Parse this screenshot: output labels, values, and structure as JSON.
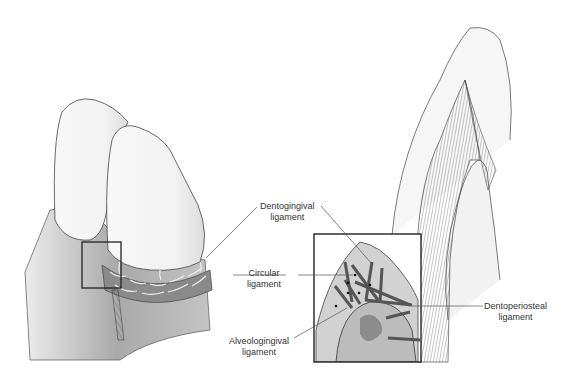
{
  "figure": {
    "panels": [
      {
        "id": "left",
        "description": "Incisor teeth with gingival fiber ring, boxed region"
      },
      {
        "id": "inset",
        "description": "Magnified boxed region showing fiber bundles"
      },
      {
        "id": "right",
        "description": "Sagittal section of tooth and gingiva"
      }
    ]
  },
  "labels": {
    "dentogingival": {
      "line1": "Dentogingival",
      "line2": "ligament"
    },
    "circular": {
      "line1": "Circular",
      "line2": "ligament"
    },
    "alveologingival": {
      "line1": "Alveologingival",
      "line2": "ligament"
    },
    "dentoperiosteal": {
      "line1": "Dentoperiosteal",
      "line2": "ligament"
    }
  },
  "colors": {
    "outline": "#3a3a3a",
    "gingiva_dark": "#9a9a9a",
    "gingiva_light": "#d8d8d8",
    "tooth": "#f4f4f4",
    "bone": "#bdbdbd"
  }
}
